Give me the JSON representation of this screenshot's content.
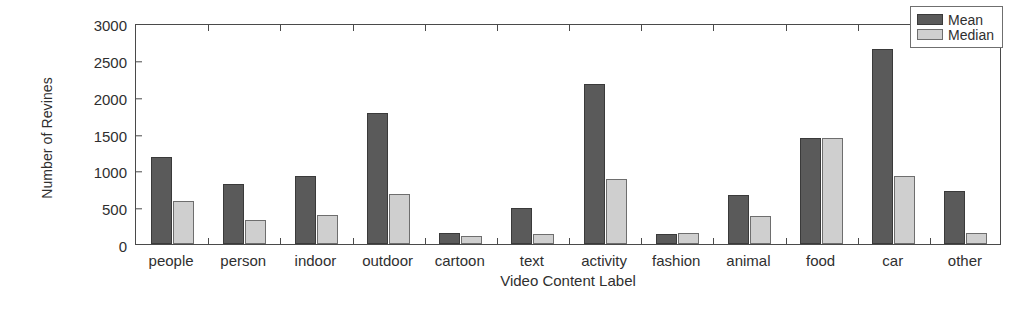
{
  "chart_data": {
    "type": "bar",
    "title": "",
    "xlabel": "Video Content Label",
    "ylabel": "Number of Revines",
    "ylim": [
      0,
      3000
    ],
    "yticks": [
      0,
      500,
      1000,
      1500,
      2000,
      2500,
      3000
    ],
    "ytick_labels": [
      "0",
      "500",
      "1000",
      "1500",
      "2000",
      "2500",
      "3000"
    ],
    "grid": false,
    "legend_position": "top-right",
    "categories": [
      "people",
      "person",
      "indoor",
      "outdoor",
      "cartoon",
      "text",
      "activity",
      "fashion",
      "animal",
      "food",
      "car",
      "other"
    ],
    "series": [
      {
        "name": "Mean",
        "color": "#5a5a5a",
        "values": [
          1180,
          810,
          920,
          1780,
          150,
          490,
          2170,
          140,
          665,
          1440,
          2650,
          715
        ]
      },
      {
        "name": "Median",
        "color": "#cfcfcf",
        "values": [
          580,
          320,
          400,
          680,
          110,
          140,
          880,
          150,
          385,
          1440,
          920,
          155
        ]
      }
    ]
  }
}
